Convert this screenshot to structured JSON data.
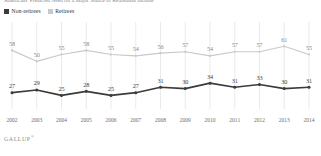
{
  "headline": {
    "text": "Americans' Predicted Need for a Major Source of Retirement Income"
  },
  "legend": {
    "position": "top-left",
    "items": [
      {
        "label": "Non-retirees",
        "color": "#3b3b3b",
        "swatch": "dark"
      },
      {
        "label": "Retirees",
        "color": "#c9c9c9",
        "swatch": "light"
      }
    ]
  },
  "footer": {
    "brand": "GALLUP",
    "mark": "®"
  },
  "chart_data": {
    "type": "line",
    "title": "",
    "xlabel": "",
    "ylabel": "",
    "ylim": [
      18,
      70
    ],
    "grid": "vertical",
    "legend_position": "top-left",
    "categories": [
      "2002",
      "2003",
      "2004",
      "2005",
      "2006",
      "2007",
      "2008",
      "2009",
      "2010",
      "2011",
      "2012",
      "2013",
      "2014"
    ],
    "series": [
      {
        "name": "Retirees",
        "color": "#c9c9c9",
        "label_color": "#8a8a8a",
        "values": [
          58,
          50,
          55,
          58,
          55,
          54,
          56,
          57,
          54,
          57,
          57,
          61,
          55
        ]
      },
      {
        "name": "Non-retirees",
        "color": "#3b3b3b",
        "label_color": "#3b3b3b",
        "values": [
          27,
          29,
          25,
          28,
          25,
          27,
          31,
          30,
          34,
          31,
          33,
          30,
          31
        ]
      }
    ]
  }
}
